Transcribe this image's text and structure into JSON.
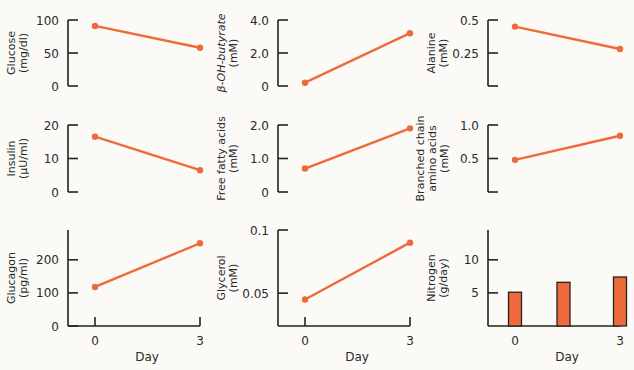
{
  "figure": {
    "accent_color": "#ee6a3a",
    "axis_color": "#222222",
    "background": "#fbfaf7"
  },
  "chart_data": [
    {
      "id": "glucose",
      "type": "line",
      "ylabel_lines": [
        "Glucose",
        "(mg/dl)"
      ],
      "x": [
        0,
        3
      ],
      "xlabel": "",
      "x_tick_labels": [],
      "values": [
        91,
        58
      ],
      "ylim": [
        0,
        100
      ],
      "yticks": [
        {
          "v": 100,
          "label": "100"
        },
        {
          "v": 50,
          "label": "50"
        },
        {
          "v": 0,
          "label": "0"
        }
      ]
    },
    {
      "id": "beta-oh-butyrate",
      "type": "line",
      "ylabel_lines": [
        "β-OH-butyrate",
        "(mM)"
      ],
      "x": [
        0,
        3
      ],
      "xlabel": "",
      "x_tick_labels": [],
      "values": [
        0.2,
        3.2
      ],
      "ylim": [
        0,
        4.0
      ],
      "yticks": [
        {
          "v": 4.0,
          "label": "4.0"
        },
        {
          "v": 2.0,
          "label": "2.0"
        },
        {
          "v": 0,
          "label": "0"
        }
      ]
    },
    {
      "id": "alanine",
      "type": "line",
      "ylabel_lines": [
        "Alanine",
        "(mM)"
      ],
      "x": [
        0,
        3
      ],
      "xlabel": "",
      "x_tick_labels": [],
      "values": [
        0.45,
        0.28
      ],
      "ylim": [
        0,
        0.5
      ],
      "yticks": [
        {
          "v": 0.5,
          "label": "0.5"
        },
        {
          "v": 0.25,
          "label": "0.25"
        },
        {
          "v": 0,
          "label": ""
        }
      ]
    },
    {
      "id": "insulin",
      "type": "line",
      "ylabel_lines": [
        "Insulin",
        "(μU/ml)"
      ],
      "x": [
        0,
        3
      ],
      "xlabel": "",
      "x_tick_labels": [],
      "values": [
        16.5,
        6.5
      ],
      "ylim": [
        0,
        20
      ],
      "yticks": [
        {
          "v": 20,
          "label": "20"
        },
        {
          "v": 10,
          "label": "10"
        },
        {
          "v": 0,
          "label": "0"
        }
      ]
    },
    {
      "id": "free-fatty-acids",
      "type": "line",
      "ylabel_lines": [
        "Free fatty acids",
        "(mM)"
      ],
      "x": [
        0,
        3
      ],
      "xlabel": "",
      "x_tick_labels": [],
      "values": [
        0.7,
        1.9
      ],
      "ylim": [
        0,
        2.0
      ],
      "yticks": [
        {
          "v": 2.0,
          "label": "2.0"
        },
        {
          "v": 1.0,
          "label": "1.0"
        },
        {
          "v": 0,
          "label": "0"
        }
      ]
    },
    {
      "id": "branched-chain-amino-acids",
      "type": "line",
      "ylabel_lines": [
        "Branched chain",
        "amino acids",
        "(mM)"
      ],
      "x": [
        0,
        3
      ],
      "xlabel": "",
      "x_tick_labels": [],
      "values": [
        0.48,
        0.84
      ],
      "ylim": [
        0,
        1.0
      ],
      "yticks": [
        {
          "v": 1.0,
          "label": "1.0"
        },
        {
          "v": 0.5,
          "label": "0.5"
        },
        {
          "v": 0,
          "label": ""
        }
      ]
    },
    {
      "id": "glucagon",
      "type": "line",
      "ylabel_lines": [
        "Glucagon",
        "(pg/ml)"
      ],
      "x": [
        0,
        3
      ],
      "xlabel": "Day",
      "x_tick_labels": [
        "0",
        "3"
      ],
      "values": [
        118,
        250
      ],
      "ylim": [
        0,
        290
      ],
      "yticks": [
        {
          "v": 200,
          "label": "200"
        },
        {
          "v": 100,
          "label": "100"
        },
        {
          "v": 0,
          "label": "0"
        }
      ]
    },
    {
      "id": "glycerol",
      "type": "line",
      "ylabel_lines": [
        "Glycerol",
        "(mM)"
      ],
      "x": [
        0,
        3
      ],
      "xlabel": "Day",
      "x_tick_labels": [
        "0",
        "3"
      ],
      "values": [
        0.045,
        0.09
      ],
      "ylim": [
        0.024,
        0.1
      ],
      "yticks": [
        {
          "v": 0.1,
          "label": "0.1"
        },
        {
          "v": 0.05,
          "label": "0.05"
        }
      ]
    },
    {
      "id": "nitrogen",
      "type": "bar",
      "ylabel_lines": [
        "Nitrogen",
        "(g/day)"
      ],
      "x": [
        0,
        1.5,
        3
      ],
      "xlabel": "Day",
      "x_tick_labels": [
        "0",
        "3"
      ],
      "categories": [
        "Day 0",
        "Day 1.5",
        "Day 3"
      ],
      "values": [
        5.1,
        6.6,
        7.4
      ],
      "ylim": [
        0,
        14.5
      ],
      "yticks": [
        {
          "v": 10,
          "label": "10"
        },
        {
          "v": 5,
          "label": "5"
        }
      ]
    }
  ]
}
